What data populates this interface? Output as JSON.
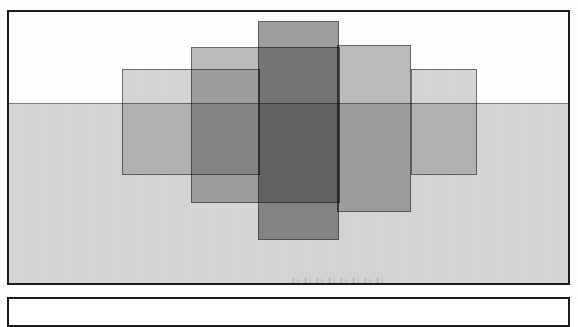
{
  "document": {
    "kind": "scanned-figure-page",
    "background_color": "#ffffff"
  },
  "figure": {
    "frame_border_color": "#1c1c1c",
    "upper_band_color": "#ffffff",
    "lower_band_color": "#d6d6d6",
    "baseline_color": "#7d7d7d",
    "caption": ""
  },
  "chart_data": {
    "type": "bar",
    "title": "",
    "subtitle": "",
    "xlabel": "",
    "ylabel": "",
    "grid": false,
    "legend_position": "none",
    "annotations": [],
    "xticklabels": [],
    "yticklabels": [],
    "xlim": [
      0,
      559
    ],
    "ylim": [
      0,
      271
    ],
    "baseline_y": 91,
    "note": "Five translucent overlapping rectangles arranged symmetrically about the centre, each straddling a horizontal baseline; darker tone indicates greater overlap.",
    "categories": [
      "bar-1",
      "bar-2",
      "bar-3",
      "bar-4",
      "bar-5"
    ],
    "values": [
      106,
      156,
      219,
      167,
      106
    ],
    "series": [
      {
        "name": "overlapping-rectangles",
        "values": [
          106,
          156,
          219,
          167,
          106
        ]
      }
    ],
    "rects": [
      {
        "id": "bar-1",
        "label": "outer-left",
        "x": 113,
        "y": 57,
        "width": 138,
        "height": 106,
        "above_baseline": 34,
        "below_baseline": 72,
        "fill": "rgba(120,120,120,0.30)",
        "tone": "lightest"
      },
      {
        "id": "bar-2",
        "label": "inner-left",
        "x": 182,
        "y": 35,
        "width": 149,
        "height": 156,
        "above_baseline": 56,
        "below_baseline": 100,
        "fill": "rgba(105,105,105,0.44)",
        "tone": "medium"
      },
      {
        "id": "bar-3",
        "label": "centre",
        "x": 249,
        "y": 9,
        "width": 81,
        "height": 219,
        "above_baseline": 82,
        "below_baseline": 137,
        "fill": "rgba(90,90,90,0.58)",
        "tone": "darkest"
      },
      {
        "id": "bar-4",
        "label": "inner-right",
        "x": 328,
        "y": 33,
        "width": 74,
        "height": 167,
        "above_baseline": 58,
        "below_baseline": 109,
        "fill": "rgba(105,105,105,0.44)",
        "tone": "medium"
      },
      {
        "id": "bar-5",
        "label": "outer-right",
        "x": 402,
        "y": 57,
        "width": 66,
        "height": 106,
        "above_baseline": 34,
        "below_baseline": 72,
        "fill": "rgba(120,120,120,0.30)",
        "tone": "lightest"
      }
    ]
  },
  "artifacts": {
    "ghost_text": "",
    "ghost_text_note": "illegible faint scan smudge near lower centre"
  }
}
